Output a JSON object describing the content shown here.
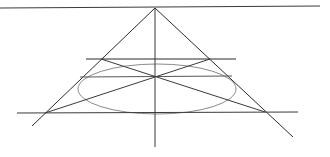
{
  "diagram": {
    "colors": {
      "background": "#ffffff",
      "line": "#2b2b2b",
      "ellipse": "#8a8a8a"
    },
    "vanishing_point": {
      "x": 155,
      "y": 8
    },
    "lines": [
      {
        "id": "horizon-line",
        "x1": 0,
        "y1": 8,
        "x2": 320,
        "y2": 6,
        "color": "#3a3a3a"
      },
      {
        "id": "left-orthogonal",
        "x1": 155,
        "y1": 8,
        "x2": 32,
        "y2": 126,
        "color": "#2b2b2b"
      },
      {
        "id": "right-orthogonal",
        "x1": 155,
        "y1": 8,
        "x2": 293,
        "y2": 137,
        "color": "#2b2b2b"
      },
      {
        "id": "center-vertical",
        "x1": 155,
        "y1": 8,
        "x2": 155,
        "y2": 147,
        "color": "#3a3a3a"
      },
      {
        "id": "far-edge",
        "x1": 86,
        "y1": 59,
        "x2": 236,
        "y2": 59,
        "color": "#2b2b2b"
      },
      {
        "id": "mid-line",
        "x1": 80,
        "y1": 77,
        "x2": 232,
        "y2": 76,
        "color": "#555555"
      },
      {
        "id": "near-edge",
        "x1": 17,
        "y1": 113,
        "x2": 298,
        "y2": 112,
        "color": "#3a3a3a"
      },
      {
        "id": "diagonal-a",
        "x1": 101,
        "y1": 59,
        "x2": 265,
        "y2": 112,
        "color": "#3a3a3a"
      },
      {
        "id": "diagonal-b",
        "x1": 45,
        "y1": 113,
        "x2": 210,
        "y2": 59,
        "color": "#3a3a3a"
      }
    ],
    "ellipse": {
      "cx": 157,
      "cy": 89,
      "rx": 79,
      "ry": 25,
      "color": "#8a8a8a"
    }
  }
}
